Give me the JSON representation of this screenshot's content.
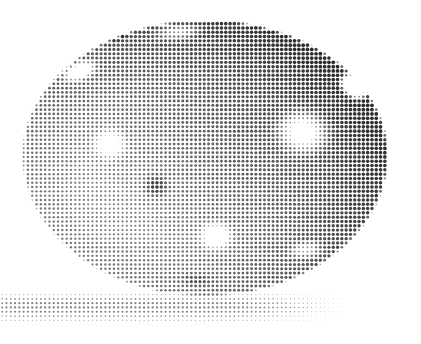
{
  "canvas": {
    "width": 421,
    "height": 344,
    "background": "#ffffff",
    "title": "Halftone dot rendering of an egg-shaped object"
  },
  "render": {
    "technique": "halftone-dot-screen",
    "dot_pitch": 4.3,
    "dot_max_radius": 2.0,
    "dot_shape": "circle",
    "dot_polarity": "dark-dots-on-white",
    "ink_color": "#1a1a1a",
    "paper_color": "#ffffff",
    "grid_angle_deg": 0
  },
  "subject": {
    "name": "egg",
    "shape": "ovoid",
    "center_x": 205,
    "center_y": 155,
    "radius_x": 184,
    "radius_y": 142,
    "squash_top": 0.92,
    "base_tone": 0.52,
    "edge_softness": 3.0,
    "bounds": {
      "left": 22,
      "top": 16,
      "right": 390,
      "bottom": 297
    },
    "shading": {
      "light_direction": "upper-right",
      "gradient_axis_deg": 35,
      "dark_side": "left",
      "light_side": "right",
      "min_tone": 0.12,
      "max_tone": 0.88
    }
  },
  "features": [
    {
      "name": "highlight-upper-left",
      "type": "specular-highlight",
      "x": 80,
      "y": 71,
      "rx": 24,
      "ry": 13,
      "rotation_deg": -22,
      "strength": 0.95
    },
    {
      "name": "highlight-left-mid",
      "type": "soft-highlight",
      "x": 110,
      "y": 144,
      "rx": 23,
      "ry": 21,
      "rotation_deg": 0,
      "strength": 0.62
    },
    {
      "name": "highlight-right-large",
      "type": "specular-highlight",
      "x": 303,
      "y": 132,
      "rx": 36,
      "ry": 30,
      "rotation_deg": 10,
      "strength": 0.92
    },
    {
      "name": "highlight-lower-center",
      "type": "soft-highlight",
      "x": 216,
      "y": 236,
      "rx": 22,
      "ry": 19,
      "rotation_deg": 0,
      "strength": 0.82
    },
    {
      "name": "highlight-lower-right",
      "type": "soft-highlight",
      "x": 306,
      "y": 250,
      "rx": 25,
      "ry": 13,
      "rotation_deg": -8,
      "strength": 0.5
    },
    {
      "name": "highlight-top-center",
      "type": "soft-highlight",
      "x": 178,
      "y": 32,
      "rx": 34,
      "ry": 12,
      "rotation_deg": -6,
      "strength": 0.55
    },
    {
      "name": "blemish-center",
      "type": "dark-spot",
      "x": 156,
      "y": 186,
      "rx": 18,
      "ry": 16,
      "rotation_deg": 0,
      "strength": -0.45
    },
    {
      "name": "blemish-upper-left-rim",
      "type": "dark-spot",
      "x": 119,
      "y": 36,
      "rx": 16,
      "ry": 8,
      "rotation_deg": -28,
      "strength": -0.3
    },
    {
      "name": "blemish-lower-center",
      "type": "dark-spot",
      "x": 196,
      "y": 280,
      "rx": 26,
      "ry": 10,
      "rotation_deg": 4,
      "strength": -0.22
    }
  ],
  "notch": {
    "name": "bite-notch-upper-right",
    "type": "cut-out",
    "points": [
      [
        336,
        62
      ],
      [
        368,
        84
      ],
      [
        372,
        106
      ],
      [
        352,
        100
      ],
      [
        336,
        80
      ]
    ],
    "x": 354,
    "y": 86,
    "rx": 22,
    "ry": 16,
    "rotation_deg": 38
  },
  "shadow": {
    "name": "cast-shadow-band",
    "type": "horizontal-halftone-band",
    "left": 0,
    "right": 332,
    "top": 294,
    "bottom": 322,
    "center_y": 307,
    "max_tone": 0.34,
    "falloff": "fade-to-right-and-edges"
  },
  "palette": {
    "ink": "#1a1a1a",
    "paper": "#ffffff",
    "midtone": "#808080",
    "shadow": "#b8b8b8"
  }
}
